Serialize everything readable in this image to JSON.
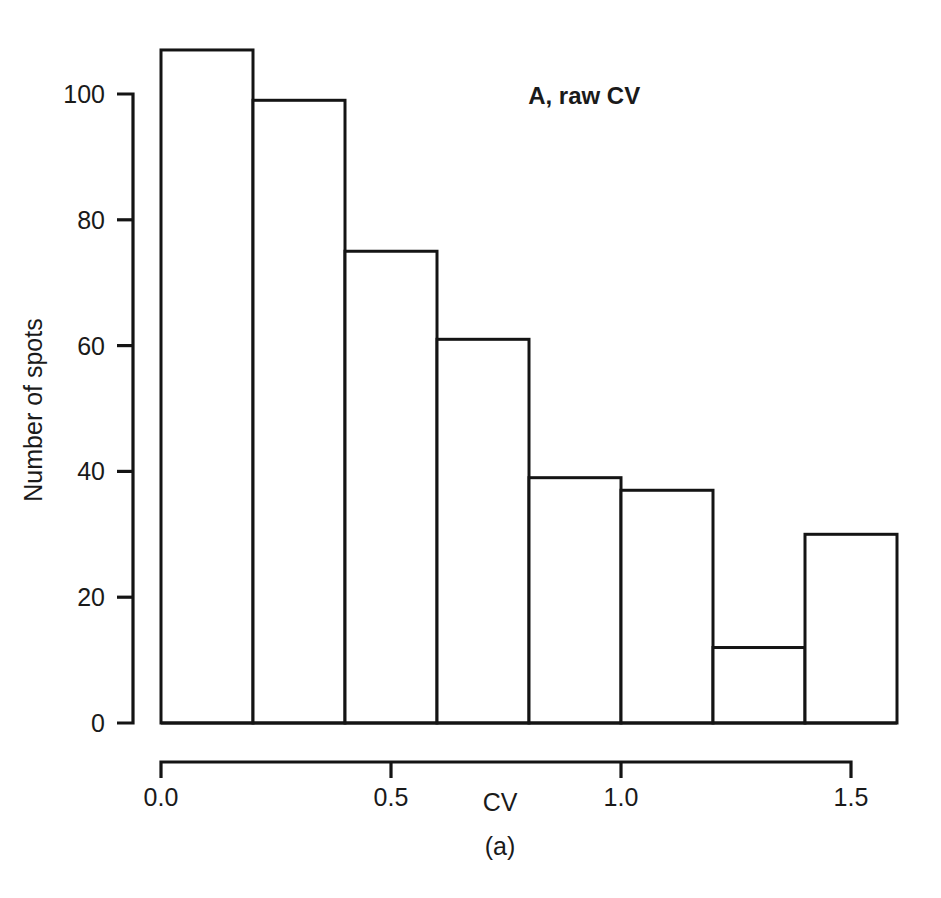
{
  "figure": {
    "panel_label": "A, raw CV",
    "caption": "(a)",
    "background_color": "#ffffff",
    "ink_color": "#141414"
  },
  "chart_data": {
    "type": "bar",
    "title": "A, raw CV",
    "xlabel": "CV",
    "ylabel": "Number of spots",
    "categories": [
      "0.0-0.2",
      "0.2-0.4",
      "0.4-0.6",
      "0.6-0.8",
      "0.8-1.0",
      "1.0-1.2",
      "1.2-1.4",
      "1.4-1.6"
    ],
    "bin_edges": [
      0.0,
      0.2,
      0.4,
      0.6,
      0.8,
      1.0,
      1.2,
      1.4,
      1.6
    ],
    "bin_width": 0.2,
    "values": [
      107,
      99,
      75,
      61,
      39,
      37,
      12,
      30
    ],
    "xlim": [
      0.0,
      1.6
    ],
    "ylim": [
      0,
      108
    ],
    "xticks": [
      0.0,
      0.5,
      1.0,
      1.5
    ],
    "xtick_labels": [
      "0.0",
      "0.5",
      "1.0",
      "1.5"
    ],
    "yticks": [
      0,
      20,
      40,
      60,
      80,
      100
    ],
    "ytick_labels": [
      "0",
      "20",
      "40",
      "60",
      "80",
      "100"
    ],
    "grid": false,
    "legend": null,
    "bar_fill": "#ffffff",
    "bar_stroke": "#141414"
  }
}
